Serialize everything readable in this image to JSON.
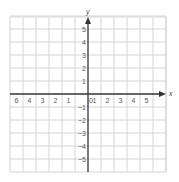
{
  "chart_data": {
    "type": "scatter",
    "title": "",
    "xlabel": "x",
    "ylabel": "y",
    "xlim": [
      -6,
      6
    ],
    "ylim": [
      -6,
      6
    ],
    "grid": true,
    "x_tick_labels": [
      "-6",
      "-4",
      "-3",
      "-2",
      "-1",
      "1",
      "2",
      "3",
      "4",
      "5"
    ],
    "x_tick_values": [
      -6,
      -5,
      -4,
      -3,
      -2,
      -1,
      1,
      2,
      3,
      4,
      5
    ],
    "x_tick_labels_rendered": [
      "6",
      "4",
      "3",
      "2",
      "1",
      "1",
      "2",
      "3",
      "4",
      "5"
    ],
    "y_tick_labels": [
      "5",
      "4",
      "3",
      "2",
      "1",
      "-1",
      "-2",
      "-3",
      "-4",
      "-5"
    ],
    "y_tick_values": [
      5,
      4,
      3,
      2,
      1,
      -1,
      -2,
      -3,
      -4,
      -5
    ],
    "origin_label": "0",
    "series": [],
    "legend": null
  },
  "colors": {
    "grid": "#d4d4d4",
    "axis": "#333333",
    "label": "#555555",
    "background": "#ffffff"
  }
}
